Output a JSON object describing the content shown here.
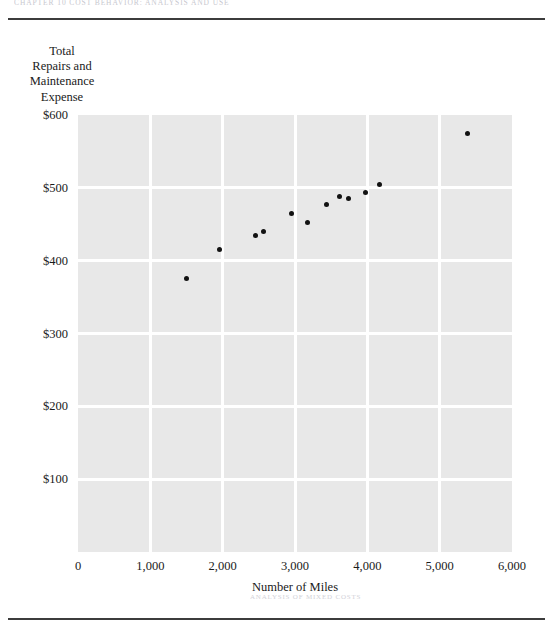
{
  "page": {
    "running_head": "CHAPTER 10  COST BEHAVIOR: ANALYSIS AND USE",
    "foot_note": "ANALYSIS OF MIXED COSTS"
  },
  "figure": {
    "y_axis_title_lines": [
      "Total",
      "Repairs and",
      "Maintenance",
      "Expense"
    ],
    "x_axis_title": "Number of Miles"
  },
  "chart_data": {
    "type": "scatter",
    "title": "",
    "xlabel": "Number of Miles",
    "ylabel": "Total Repairs and Maintenance Expense",
    "xlim": [
      0,
      6000
    ],
    "ylim": [
      0,
      600
    ],
    "xticks": [
      0,
      1000,
      2000,
      3000,
      4000,
      5000,
      6000
    ],
    "xtick_labels": [
      "0",
      "1,000",
      "2,000",
      "3,000",
      "4,000",
      "5,000",
      "6,000"
    ],
    "yticks": [
      100,
      200,
      300,
      400,
      500,
      600
    ],
    "ytick_labels": [
      "$100",
      "$200",
      "$300",
      "$400",
      "$500",
      "$600"
    ],
    "grid": true,
    "legend": "none",
    "plot_background": "#e8e8e8",
    "gridline_color": "#ffffff",
    "marker_color": "#121212",
    "points": [
      {
        "x": 1500,
        "y": 375
      },
      {
        "x": 1950,
        "y": 415
      },
      {
        "x": 2450,
        "y": 435
      },
      {
        "x": 2560,
        "y": 440
      },
      {
        "x": 2950,
        "y": 465
      },
      {
        "x": 3170,
        "y": 452
      },
      {
        "x": 3440,
        "y": 477
      },
      {
        "x": 3610,
        "y": 488
      },
      {
        "x": 3735,
        "y": 486
      },
      {
        "x": 3970,
        "y": 493
      },
      {
        "x": 4165,
        "y": 505
      },
      {
        "x": 5380,
        "y": 574
      }
    ]
  }
}
